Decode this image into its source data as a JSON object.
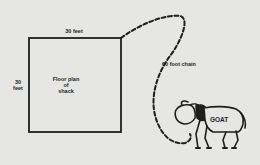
{
  "diagram": {
    "shack": {
      "top_dimension": "30 feet",
      "side_dimension_line1": "30",
      "side_dimension_line2": "feet",
      "label_line1": "Floor plan",
      "label_line2": "of",
      "label_line3": "shack"
    },
    "chain": {
      "label": "60 foot chain",
      "style": "dashed"
    },
    "animal": {
      "label": "GOAT"
    },
    "colors": {
      "background": "#e6e6e4",
      "ink": "#1e1e1e"
    }
  }
}
